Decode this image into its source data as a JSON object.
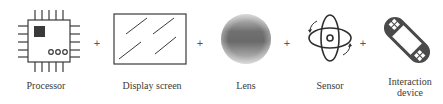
{
  "diagram": {
    "operator": "+",
    "components": [
      {
        "id": "processor",
        "label": "Processor",
        "icon": "processor-chip-icon"
      },
      {
        "id": "display",
        "label": "Display screen",
        "icon": "display-screen-icon"
      },
      {
        "id": "lens",
        "label": "Lens",
        "icon": "lens-icon"
      },
      {
        "id": "sensor",
        "label": "Sensor",
        "icon": "gyroscope-sensor-icon"
      },
      {
        "id": "interaction",
        "label_line1": "Interaction",
        "label_line2": "device",
        "icon": "handheld-game-device-icon"
      }
    ],
    "colors": {
      "stroke": "#3a3a3a",
      "fill_dark": "#4a4a4a",
      "lens_center": "#6e6e6e",
      "lens_edge": "#b8b8b8"
    }
  }
}
